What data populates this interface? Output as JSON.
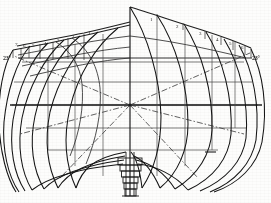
{
  "figure": {
    "kind": "ship-hull-body-plan",
    "background_color": "#fdfdfc",
    "ink_color": "#262626",
    "grid_color": "#555555",
    "centerline_x": 130,
    "base_y": 196
  },
  "labels": {
    "right_angle": "23°",
    "left_angle": "23°",
    "left_station": "7",
    "stations_right": [
      "1",
      "2",
      "3",
      "4",
      "5",
      "6"
    ],
    "stations_left": [
      "1",
      "2",
      "3",
      "4",
      "5",
      "6",
      "7"
    ],
    "mark_right": "—"
  },
  "annotations": [
    {
      "name": "left-angle-label",
      "text": "23°",
      "x": 5,
      "y": 60
    },
    {
      "name": "left-station-7",
      "text": "7",
      "x": 15,
      "y": 48
    },
    {
      "name": "left-station-6",
      "text": "6",
      "x": 23,
      "y": 48
    },
    {
      "name": "left-station-5",
      "text": "5",
      "x": 31,
      "y": 48
    },
    {
      "name": "left-station-4",
      "text": "4",
      "x": 42,
      "y": 45
    },
    {
      "name": "left-station-3",
      "text": "3",
      "x": 55,
      "y": 43
    },
    {
      "name": "left-station-2",
      "text": "2",
      "x": 70,
      "y": 39
    },
    {
      "name": "left-station-1",
      "text": "1",
      "x": 85,
      "y": 36
    },
    {
      "name": "right-station-1",
      "text": "1",
      "x": 152,
      "y": 21
    },
    {
      "name": "right-station-2",
      "text": "2",
      "x": 178,
      "y": 23
    },
    {
      "name": "right-station-3",
      "text": "3",
      "x": 200,
      "y": 29
    },
    {
      "name": "right-station-4",
      "text": "4",
      "x": 216,
      "y": 34
    },
    {
      "name": "right-station-5",
      "text": "5",
      "x": 228,
      "y": 38
    },
    {
      "name": "right-station-6",
      "text": "6",
      "x": 240,
      "y": 42
    },
    {
      "name": "right-angle-label",
      "text": "23°",
      "x": 252,
      "y": 58
    }
  ],
  "geometry": {
    "waterlines_y": [
      62,
      82,
      105,
      128,
      150
    ],
    "full_waterline_y": 105,
    "buttocks_x": [
      48,
      75,
      103,
      130,
      157,
      185,
      212
    ],
    "sheer_left": "M 14,50 L 30,47 L 52,43 L 78,37 L 104,31 L 130,26",
    "sheer_right": "M 130,7 L 160,17 L 190,26 L 215,34 L 240,42 L 250,47",
    "centerline": "M 130,7 L 130,196",
    "hull_left_outer": "M 14,50 C 6,72 8,104 20,130 C 33,158 62,178 100,186",
    "hull_right_outer": "M 250,47 C 262,72 260,104 247,131 C 233,160 200,180 160,187"
  },
  "station_curves_right": [
    "M 130,7 C 152,40 162,86 160,132 C 159,158 152,176 140,187",
    "M 160,17 C 180,48 190,92 186,134 C 183,160 172,178 152,188",
    "M 190,26 C 208,56 216,96 212,136 C 208,162 192,180 166,188",
    "M 215,34 C 231,62 238,100 234,138 C 229,163 212,181 180,189",
    "M 240,42 C 253,68 258,104 253,140 C 247,165 226,183 192,190",
    "M 250,47 C 262,72 266,106 260,142 C 253,168 230,185 200,191"
  ],
  "station_curves_left": [
    "M 104,31 C 80,52 62,82 54,116 C 48,144 52,170 62,188",
    "M 78,37 C 56,56 40,86 33,118 C 28,146 32,170 42,188",
    "M 52,43 C 34,60 22,88 17,120 C 13,148 18,172 28,189",
    "M 30,47 C 18,63 10,90 8,121 C 6,149 12,174 22,190",
    "M 14,50 C 5,66 0,92 0,122 C 0,150 6,176 16,191"
  ],
  "diagonals": [
    "M 130,105 L 14,56",
    "M 130,105 L 22,132",
    "M 130,105 L 60,177",
    "M 130,105 L 250,53",
    "M 130,105 L 243,133",
    "M 130,105 L 198,178"
  ],
  "keel": {
    "steps": [
      {
        "x": 118,
        "y": 160,
        "w": 24,
        "h": 7
      },
      {
        "x": 120,
        "y": 167,
        "w": 21,
        "h": 6
      },
      {
        "x": 121,
        "y": 173,
        "w": 19,
        "h": 6
      },
      {
        "x": 122,
        "y": 179,
        "w": 17,
        "h": 6
      },
      {
        "x": 123,
        "y": 185,
        "w": 15,
        "h": 6
      },
      {
        "x": 124,
        "y": 191,
        "w": 13,
        "h": 6
      }
    ]
  }
}
